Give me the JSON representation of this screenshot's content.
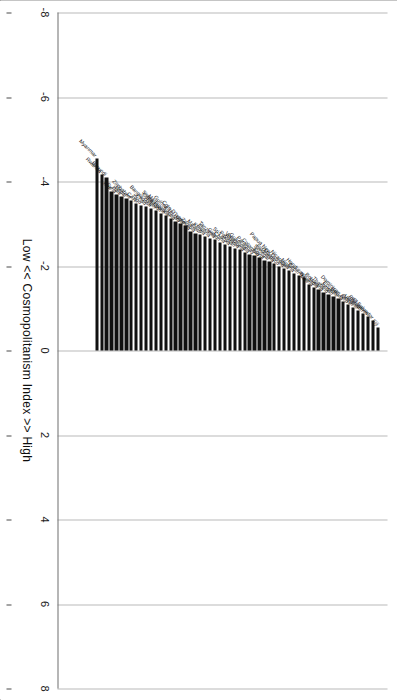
{
  "chart_data": {
    "type": "bar",
    "orientation": "vertical-bars-downward",
    "title": "",
    "xlabel": "Low  <<   Cosmopolitanism Index   >>   High",
    "ylabel": "",
    "axis_label_left": "Low",
    "axis_label_left_arrow": "<<",
    "axis_label_center": "Cosmopolitanism Index",
    "axis_label_right_arrow": ">>",
    "axis_label_right": "High",
    "ylim": [
      -8,
      8
    ],
    "ticks": [
      -8,
      -6,
      -4,
      -2,
      0,
      2,
      4,
      6,
      8
    ],
    "tick_labels": [
      "-8",
      "-6",
      "-4",
      "-2",
      "0",
      "2",
      "4",
      "6",
      "8"
    ],
    "grid": true,
    "grid_axis": "value",
    "legend": null,
    "bar_color": "#111111",
    "categories": [
      "Fiji",
      "El Salvador",
      "Philippines",
      "Bahrain",
      "Ukraine",
      "Oman",
      "Dominican Rep",
      "Bolivia",
      "Ecuador",
      "Jordan",
      "Thailand",
      "Botswana",
      "India",
      "Nigeria",
      "Mali",
      "Honduras",
      "Benin",
      "Nigeria",
      "Nicaragua",
      "Papua New Guinea",
      "Morocco",
      "Indonesia",
      "Senegal",
      "Egypt",
      "Colombia",
      "Paraguay",
      "Guatemala",
      "Venezuela",
      "Albania",
      "Pakistan",
      "Sri Lanka",
      "China",
      "Gabon",
      "Tanzania",
      "Algeria",
      "Kenya",
      "Malawi",
      "Zambia",
      "Uganda",
      "Cote D'Ivoire",
      "Guinea-Bissau",
      "Tunisia",
      "Madagascar",
      "Sierra Leone",
      "Cameroon",
      "Niger",
      "Bangladesh",
      "Chad",
      "Togo",
      "CAR",
      "Zimbabwe",
      "Nepal",
      "Haiti",
      "Syria",
      "Iran",
      "Burundi",
      "Rwanda",
      "Myanmar"
    ],
    "values": [
      -0.55,
      -0.72,
      -0.8,
      -0.88,
      -0.95,
      -1.02,
      -1.1,
      -1.16,
      -1.22,
      -1.28,
      -1.33,
      -1.38,
      -1.44,
      -1.5,
      -1.56,
      -1.72,
      -1.77,
      -1.82,
      -1.9,
      -1.95,
      -2.0,
      -2.05,
      -2.1,
      -2.14,
      -2.2,
      -2.24,
      -2.28,
      -2.32,
      -2.38,
      -2.42,
      -2.46,
      -2.5,
      -2.55,
      -2.62,
      -2.66,
      -2.7,
      -2.74,
      -2.78,
      -2.82,
      -2.95,
      -3.0,
      -3.05,
      -3.12,
      -3.2,
      -3.25,
      -3.32,
      -3.36,
      -3.4,
      -3.44,
      -3.48,
      -3.56,
      -3.6,
      -3.64,
      -3.7,
      -3.76,
      -4.1,
      -4.16,
      -4.55
    ]
  }
}
